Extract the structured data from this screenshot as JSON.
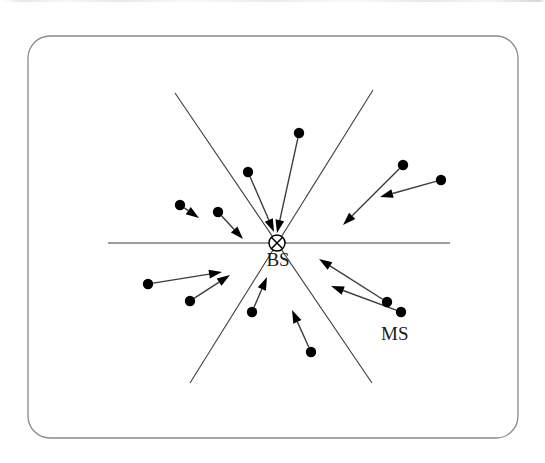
{
  "figure": {
    "background_color": "#ffffff",
    "stroke_color": "#3c3c3c",
    "dot_color": "#000000",
    "label_color": "#1a1a1a",
    "frame": {
      "x": 28,
      "y": 36,
      "width": 490,
      "height": 402,
      "corner_radius": 22,
      "stroke_width": 1.3,
      "stroke_color": "#8a8a8a"
    },
    "labels": [
      {
        "id": "bs",
        "text": "BS",
        "x": 278,
        "y": 266,
        "font_size": 19
      },
      {
        "id": "ms",
        "text": "MS",
        "x": 381,
        "y": 340,
        "font_size": 19
      }
    ],
    "base_station": {
      "name": "BS",
      "center_x": 277,
      "center_y": 243,
      "radius": 8,
      "marker": "circle-with-x"
    },
    "sector_lines": [
      {
        "id": "horizontal-axis",
        "x1": 108,
        "y1": 243,
        "x2": 450,
        "y2": 243
      },
      {
        "id": "sector-line-upper-left-lower-right",
        "x1": 175,
        "y1": 93,
        "x2": 372,
        "y2": 383
      },
      {
        "id": "sector-line-upper-right-lower-left",
        "x1": 373,
        "y1": 90,
        "x2": 190,
        "y2": 383
      }
    ],
    "mobile_stations": [
      {
        "id": "ms-01",
        "dot_x": 299,
        "dot_y": 133,
        "tip_x": 277,
        "tip_y": 233
      },
      {
        "id": "ms-02",
        "dot_x": 248,
        "dot_y": 172,
        "tip_x": 274,
        "tip_y": 232
      },
      {
        "id": "ms-03",
        "dot_x": 403,
        "dot_y": 165,
        "tip_x": 343,
        "tip_y": 225
      },
      {
        "id": "ms-04",
        "dot_x": 441,
        "dot_y": 180,
        "tip_x": 380,
        "tip_y": 197
      },
      {
        "id": "ms-05",
        "dot_x": 180,
        "dot_y": 205,
        "tip_x": 199,
        "tip_y": 218
      },
      {
        "id": "ms-06",
        "dot_x": 218,
        "dot_y": 212,
        "tip_x": 243,
        "tip_y": 239
      },
      {
        "id": "ms-07",
        "dot_x": 148,
        "dot_y": 284,
        "tip_x": 222,
        "tip_y": 272
      },
      {
        "id": "ms-08",
        "dot_x": 190,
        "dot_y": 301,
        "tip_x": 230,
        "tip_y": 275
      },
      {
        "id": "ms-09",
        "dot_x": 252,
        "dot_y": 312,
        "tip_x": 267,
        "tip_y": 277
      },
      {
        "id": "ms-10",
        "dot_x": 311,
        "dot_y": 352,
        "tip_x": 292,
        "tip_y": 310
      },
      {
        "id": "ms-11",
        "dot_x": 387,
        "dot_y": 302,
        "tip_x": 319,
        "tip_y": 259
      },
      {
        "id": "ms-12",
        "dot_x": 401,
        "dot_y": 312,
        "tip_x": 331,
        "tip_y": 286
      }
    ],
    "dot_radius": 5.2,
    "arrow_head": {
      "length": 13,
      "half_width": 4.4
    },
    "line_width": 1.4
  }
}
